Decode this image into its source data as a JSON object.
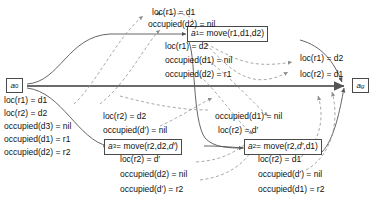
{
  "diagram": {
    "type": "partial-order-plan-space-graph",
    "nodes": {
      "start": {
        "id": "a",
        "sub": "0",
        "label": "a"
      },
      "goal": {
        "id": "ag",
        "sub": "g",
        "label": "a"
      },
      "a1": {
        "label": "a",
        "sub": "1",
        "text": " = move(r1,d1,d2)"
      },
      "a2": {
        "label": "a",
        "sub": "2",
        "text": " = move(r2,",
        "italic": "d′",
        "text2": ",d1)"
      },
      "a3": {
        "label": "a",
        "sub": "3",
        "text": " = move(r2,d2,",
        "italic": "d′",
        "text2": ")"
      }
    },
    "start_state": [
      "loc(r1) = d1",
      "loc(r2) = d2",
      "occupied(d3) = nil",
      "occupied(d1) = r1",
      "occupied(d2) = r2"
    ],
    "a1_preconditions": [
      "loc(r1) = d1",
      "occupied(d2) = nil"
    ],
    "a1_effects": [
      "loc(r1) = d2",
      "occupied(d1) = nil",
      "occupied(d2) = r1"
    ],
    "a3_preconditions": [
      "loc(r2) = d2",
      "occupied(d′) = nil"
    ],
    "a3_effects": [
      "loc(r2) = d′",
      "occupied(d2) = nil",
      "occupied(d′) = r2"
    ],
    "a2_preconditions": [
      "occupied(d1) = nil",
      "loc(r2) = d′"
    ],
    "a2_effects": [
      "loc(r2) = d1",
      "occupied(d′) = nil",
      "occupied(d1) = r2"
    ],
    "goal_conditions": [
      "loc(r1) = d2",
      "loc(r2) = d1"
    ],
    "colors": {
      "node_border": "#4a4a4a",
      "solid_edge": "#555555",
      "dashed_edge": "#999999",
      "text": "#111111"
    }
  }
}
